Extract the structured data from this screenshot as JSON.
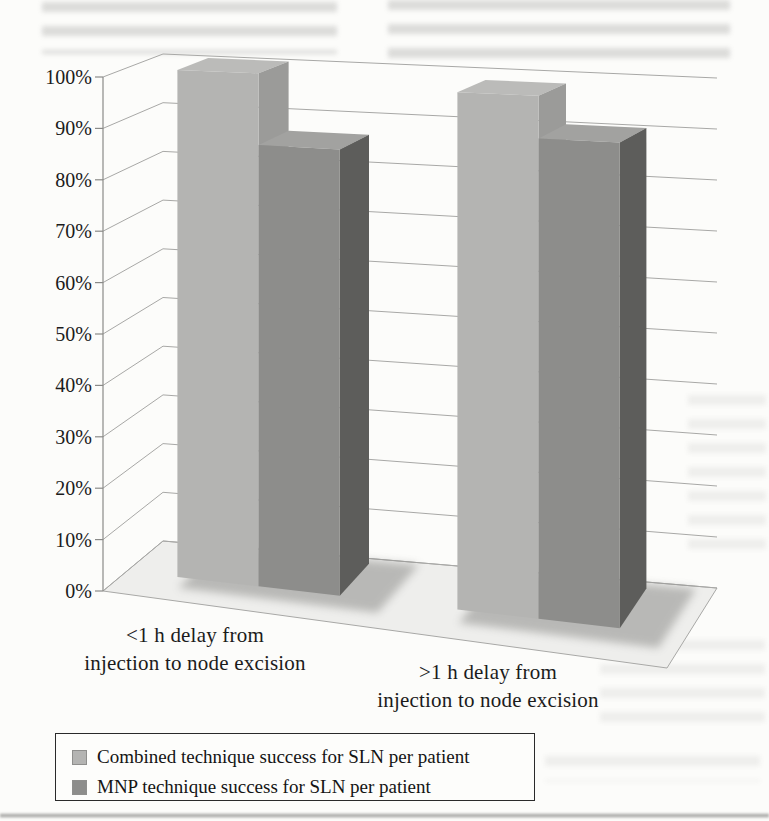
{
  "chart_data": {
    "type": "bar",
    "projection": "3d-column",
    "title": "",
    "xlabel": "",
    "ylabel": "",
    "categories": [
      "<1 h delay from injection to node excision",
      ">1 h delay from injection to node excision"
    ],
    "categories_lines": [
      [
        "<1 h delay from",
        "injection to node excision"
      ],
      [
        ">1 h delay from",
        "injection to node excision"
      ]
    ],
    "series": [
      {
        "name": "Combined technique success for SLN per patient",
        "values": [
          100,
          98
        ],
        "color": "#b4b4b2",
        "color_side": "#9b9b99",
        "color_top": "#bbbbb9"
      },
      {
        "name": "MNP technique success for SLN per patient",
        "values": [
          86,
          90
        ],
        "color": "#8d8d8b",
        "color_side": "#5d5d5b",
        "color_top": "#a2a2a0"
      }
    ],
    "ylim": [
      0,
      100
    ],
    "ytick_step": 10,
    "ytick_labels": [
      "0%",
      "10%",
      "20%",
      "30%",
      "40%",
      "50%",
      "60%",
      "70%",
      "80%",
      "90%",
      "100%"
    ],
    "grid": true,
    "legend_position": "bottom-left",
    "gridline_color": "#a8a8a6",
    "axis_color": "#8a8a88",
    "floor_color": "#eeeeec",
    "shadow_color": "#6f6f6d"
  }
}
